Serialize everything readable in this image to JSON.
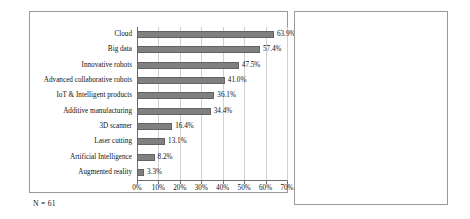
{
  "footnote": "N = 61",
  "colors": {
    "bar_fill": "#808080",
    "bar_stroke": "#636363",
    "gridline": "#d0d0d0",
    "axis": "#6e6e6e",
    "panel_border": "#9a9a9a",
    "background": "#ffffff",
    "text": "#111111"
  },
  "chart_data": [
    {
      "type": "bar",
      "orientation": "horizontal",
      "title": "",
      "xlabel": "",
      "ylabel": "",
      "xlim": [
        0,
        70
      ],
      "grid": "vertical",
      "legend": "none",
      "value_suffix": "%",
      "xticks": [
        "0%",
        "10%",
        "20%",
        "30%",
        "40%",
        "50%",
        "60%",
        "70%"
      ],
      "xtick_values": [
        0,
        10,
        20,
        30,
        40,
        50,
        60,
        70
      ],
      "categories": [
        "Cloud",
        "Big data",
        "Innovative robots",
        "Advanced collaborative robots",
        "IoT & Intelligent products",
        "Additive manufacturing",
        "3D scanner",
        "Laser cutting",
        "Artificial Intelligence",
        "Augmented reality"
      ],
      "values": [
        63.9,
        57.4,
        47.5,
        41.0,
        36.1,
        34.4,
        16.4,
        13.1,
        8.2,
        3.3
      ],
      "data_labels": [
        "63.9%",
        "57.4%",
        "47.5%",
        "41.0%",
        "36.1%",
        "34.4%",
        "16.4%",
        "13.1%",
        "8.2%",
        "3.3%"
      ]
    },
    {
      "type": "bar",
      "orientation": "vertical",
      "title": "",
      "xlabel": "",
      "ylabel": "",
      "ylim": [
        0,
        80
      ],
      "grid": "horizontal",
      "legend": "none",
      "value_suffix": "%",
      "yticks": [
        "0%",
        "10%",
        "20%",
        "30%",
        "40%",
        "50%",
        "60%",
        "70%",
        "80%"
      ],
      "ytick_values": [
        0,
        10,
        20,
        30,
        40,
        50,
        60,
        70,
        80
      ],
      "categories": [
        "One-two technologies",
        "Three-more technologies"
      ],
      "category_lines": [
        [
          "One-two",
          "technologies"
        ],
        [
          "Three-more",
          "technologies"
        ]
      ],
      "values": [
        29.5,
        70.5
      ],
      "data_labels": [
        "29.5%",
        "70.5%"
      ]
    }
  ]
}
